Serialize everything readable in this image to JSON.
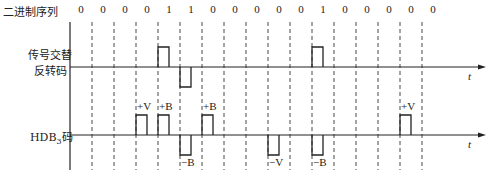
{
  "labels": {
    "binary_sequence": "二进制序列",
    "ami_line1": "传号交替",
    "ami_line2": "反转码",
    "hdb3": "HDB",
    "hdb3_sub": "3",
    "hdb3_suffix": "码",
    "time_axis": "t"
  },
  "bits": [
    "0",
    "0",
    "0",
    "0",
    "1",
    "1",
    "0",
    "0",
    "0",
    "0",
    "0",
    "1",
    "0",
    "0",
    "0",
    "0",
    "0"
  ],
  "ami_pulses": [
    {
      "slot": 4,
      "polarity": 1
    },
    {
      "slot": 5,
      "polarity": -1
    },
    {
      "slot": 11,
      "polarity": 1
    }
  ],
  "hdb3_pulses": [
    {
      "slot": 3,
      "polarity": 1,
      "label": "+V"
    },
    {
      "slot": 4,
      "polarity": 1,
      "label": "+B"
    },
    {
      "slot": 5,
      "polarity": -1,
      "label": "−B"
    },
    {
      "slot": 6,
      "polarity": 1,
      "label": "+B"
    },
    {
      "slot": 9,
      "polarity": -1,
      "label": "−V"
    },
    {
      "slot": 11,
      "polarity": -1,
      "label": "−B"
    },
    {
      "slot": 15,
      "polarity": 1,
      "label": "+V"
    }
  ]
}
